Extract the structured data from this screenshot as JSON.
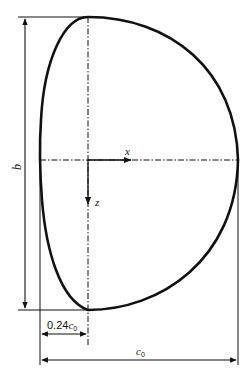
{
  "diagram": {
    "colors": {
      "stroke": "#111111",
      "background": "#ffffff"
    },
    "axes": {
      "x_label": "x",
      "z_label": "z"
    },
    "dimensions": {
      "span_label": "b",
      "offset_label_value": "0.24",
      "offset_label_symbol": "c",
      "offset_label_subscript": "0",
      "chord_label_symbol": "c",
      "chord_label_subscript": "0"
    }
  }
}
